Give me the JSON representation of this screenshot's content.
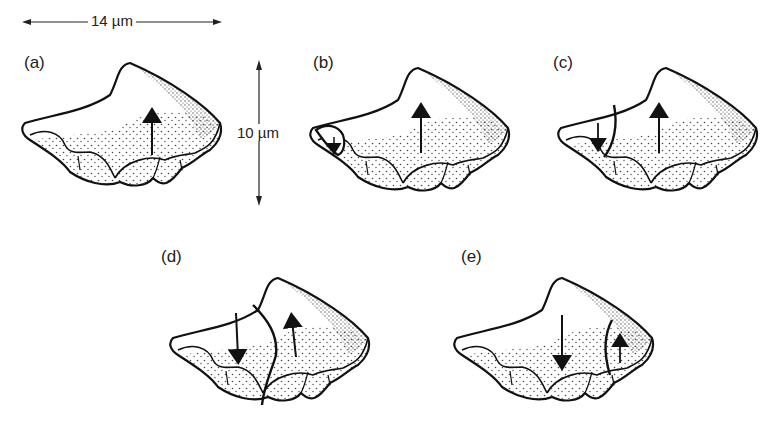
{
  "figure": {
    "scale_bars": {
      "horizontal": {
        "label": "14 µm",
        "orientation": "horizontal"
      },
      "vertical": {
        "label": "10 µm",
        "orientation": "vertical"
      }
    },
    "panels": [
      {
        "id": "a",
        "label": "(a)",
        "domains": 1,
        "arrows": [
          "up"
        ],
        "description": "single domain, magnetization up"
      },
      {
        "id": "b",
        "label": "(b)",
        "domains": 2,
        "arrows": [
          "up",
          "down-small-left"
        ],
        "description": "small reversed domain nucleates at left tip"
      },
      {
        "id": "c",
        "label": "(c)",
        "domains": 2,
        "arrows": [
          "down",
          "up"
        ],
        "description": "reversed domain grows at left"
      },
      {
        "id": "d",
        "label": "(d)",
        "domains": 2,
        "arrows": [
          "down",
          "up"
        ],
        "description": "domain wall moves to center"
      },
      {
        "id": "e",
        "label": "(e)",
        "domains": 2,
        "arrows": [
          "down",
          "up-small-right"
        ],
        "description": "domain wall pushed to right edge"
      }
    ],
    "colors": {
      "ink": "#1a1a1a",
      "background": "#ffffff"
    }
  }
}
